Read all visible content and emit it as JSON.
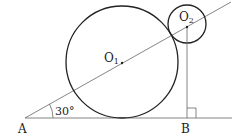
{
  "diagram": {
    "angle_label": "30°",
    "points": {
      "A": "A",
      "B": "B",
      "O1": "O",
      "O1_sub": "1",
      "O2": "O",
      "O2_sub": "2"
    },
    "colors": {
      "stroke": "#222222",
      "thin": "#555555",
      "background": "#ffffff"
    }
  }
}
